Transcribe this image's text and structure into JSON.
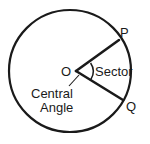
{
  "figure": {
    "kind": "circle-sector-diagram",
    "background_color": "#ffffff",
    "stroke_color": "#1a1a1a",
    "text_color": "#1a1a1a",
    "labels": {
      "center": "O",
      "point_upper": "P",
      "point_lower": "Q",
      "region": "Sector",
      "angle_line1": "Central",
      "angle_line2": "Angle"
    }
  },
  "geometry": {
    "circle": {
      "cx": 70,
      "cy": 71,
      "r": 61
    },
    "vertex": {
      "x": 76,
      "y": 71
    },
    "radius_upper_end": {
      "x": 119,
      "y": 40
    },
    "radius_lower_end": {
      "x": 123,
      "y": 100
    },
    "angle_arc_radius": 15,
    "leader_from": {
      "x": 79,
      "y": 75
    },
    "leader_to": {
      "x": 69,
      "y": 86
    }
  }
}
